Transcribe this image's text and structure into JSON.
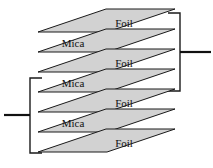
{
  "figure": {
    "background_color": "#ffffff",
    "plate_fill_color": "#d2d2d2",
    "plate_edge_color": "#1a1a1a",
    "lead_color": "#111111",
    "plate_count": 7,
    "foil_count": 4,
    "mica_count": 3
  },
  "plates": [
    {
      "index": 0,
      "label": "Foil",
      "material": "foil",
      "label_align": "right",
      "y": 32
    },
    {
      "index": 1,
      "label": "Mica",
      "material": "mica",
      "label_align": "left",
      "y": 52
    },
    {
      "index": 2,
      "label": "Foil",
      "material": "foil",
      "label_align": "right",
      "y": 72
    },
    {
      "index": 3,
      "label": "Mica",
      "material": "mica",
      "label_align": "left",
      "y": 92
    },
    {
      "index": 4,
      "label": "Foil",
      "material": "foil",
      "label_align": "right",
      "y": 112
    },
    {
      "index": 5,
      "label": "Mica",
      "material": "mica",
      "label_align": "left",
      "y": 132
    },
    {
      "index": 6,
      "label": "Foil",
      "material": "foil",
      "label_align": "right",
      "y": 152
    }
  ],
  "connectors": {
    "right": {
      "name": "right-terminal",
      "connects_plates": [
        0,
        2,
        4
      ],
      "bracket_x": 180,
      "bracket_top_y": 13,
      "bracket_bottom_y": 91,
      "terminal_y": 52,
      "terminal_end_x": 211
    },
    "left": {
      "name": "left-terminal",
      "connects_plates": [
        2,
        4,
        6
      ],
      "bracket_x": 30,
      "bracket_top_y": 78,
      "bracket_bottom_y": 153,
      "terminal_y": 115,
      "terminal_end_x": 4
    }
  }
}
